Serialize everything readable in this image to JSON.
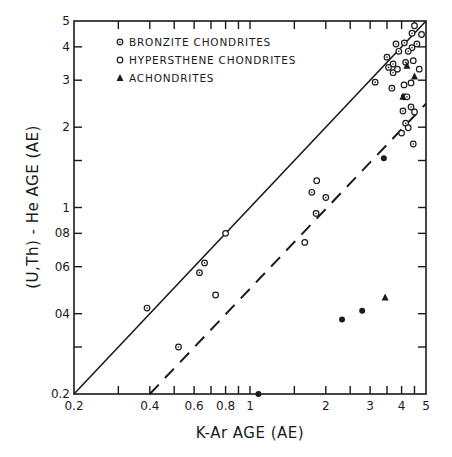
{
  "chart_data": {
    "type": "scatter",
    "title": "",
    "xlabel": "K-Ar AGE (AE)",
    "ylabel": "(U,Th) - He AGE (AE)",
    "xscale": "log",
    "yscale": "log",
    "xlim": [
      0.2,
      5
    ],
    "ylim": [
      0.2,
      5
    ],
    "grid": false,
    "legend_position": "upper-left (inside)",
    "x_ticks": [
      {
        "value": 0.2,
        "label": "0.2"
      },
      {
        "value": 0.3,
        "label": ""
      },
      {
        "value": 0.4,
        "label": "0.4"
      },
      {
        "value": 0.5,
        "label": ""
      },
      {
        "value": 0.6,
        "label": "0.6"
      },
      {
        "value": 0.7,
        "label": ""
      },
      {
        "value": 0.8,
        "label": "0.8"
      },
      {
        "value": 0.9,
        "label": ""
      },
      {
        "value": 1,
        "label": "1"
      },
      {
        "value": 1.5,
        "label": ""
      },
      {
        "value": 2,
        "label": "2"
      },
      {
        "value": 2.5,
        "label": ""
      },
      {
        "value": 3,
        "label": "3"
      },
      {
        "value": 3.5,
        "label": ""
      },
      {
        "value": 4,
        "label": "4"
      },
      {
        "value": 4.5,
        "label": ""
      },
      {
        "value": 5,
        "label": "5"
      }
    ],
    "y_ticks": [
      {
        "value": 0.2,
        "label": "0.2"
      },
      {
        "value": 0.3,
        "label": ""
      },
      {
        "value": 0.4,
        "label": "04"
      },
      {
        "value": 0.6,
        "label": "06"
      },
      {
        "value": 0.8,
        "label": "08"
      },
      {
        "value": 1,
        "label": "1"
      },
      {
        "value": 1.5,
        "label": ""
      },
      {
        "value": 2,
        "label": "2"
      },
      {
        "value": 3,
        "label": "3"
      },
      {
        "value": 4,
        "label": "4"
      },
      {
        "value": 5,
        "label": "5"
      }
    ],
    "reference_lines": [
      {
        "name": "equal-ages",
        "style": "solid",
        "points": [
          [
            0.2,
            0.2
          ],
          [
            5,
            5
          ]
        ]
      },
      {
        "name": "half-ratio",
        "style": "dashed",
        "points": [
          [
            0.4,
            0.2
          ],
          [
            5,
            2.45
          ]
        ]
      }
    ],
    "legend": [
      {
        "label": "BRONZITE CHONDRITES",
        "marker": "circle-dot"
      },
      {
        "label": "HYPERSTHENE CHONDRITES",
        "marker": "open-circle"
      },
      {
        "label": "ACHONDRITES",
        "marker": "filled-triangle"
      }
    ],
    "series": [
      {
        "name": "BRONZITE CHONDRITES",
        "marker": "circle-dot",
        "points": [
          [
            0.39,
            0.42
          ],
          [
            0.63,
            0.57
          ],
          [
            0.66,
            0.62
          ],
          [
            0.52,
            0.3
          ],
          [
            1.76,
            1.14
          ],
          [
            1.83,
            0.95
          ],
          [
            2.0,
            1.09
          ],
          [
            3.14,
            2.95
          ],
          [
            3.66,
            2.8
          ],
          [
            4.1,
            2.6
          ],
          [
            4.2,
            2.6
          ],
          [
            4.05,
            2.3
          ],
          [
            4.36,
            2.38
          ],
          [
            4.15,
            2.07
          ],
          [
            4.45,
            1.73
          ],
          [
            3.5,
            3.66
          ],
          [
            3.7,
            3.45
          ],
          [
            3.9,
            3.85
          ],
          [
            4.1,
            4.14
          ],
          [
            4.4,
            4.5
          ],
          [
            4.4,
            3.97
          ],
          [
            4.6,
            4.1
          ],
          [
            3.7,
            3.2
          ],
          [
            4.15,
            3.5
          ],
          [
            3.8,
            4.1
          ],
          [
            4.25,
            3.85
          ],
          [
            3.55,
            3.35
          ]
        ]
      },
      {
        "name": "HYPERSTHENE CHONDRITES",
        "marker": "open-circle",
        "points": [
          [
            0.8,
            0.8
          ],
          [
            0.73,
            0.47
          ],
          [
            1.84,
            1.26
          ],
          [
            1.65,
            0.74
          ],
          [
            4.09,
            2.88
          ],
          [
            4.36,
            2.93
          ],
          [
            4.5,
            2.28
          ],
          [
            4.25,
            1.99
          ],
          [
            4.0,
            1.9
          ],
          [
            3.85,
            3.3
          ],
          [
            4.45,
            3.55
          ],
          [
            4.7,
            3.3
          ],
          [
            4.8,
            4.45
          ],
          [
            4.5,
            4.8
          ]
        ]
      },
      {
        "name": "ACHONDRITES",
        "marker": "filled-triangle",
        "points": [
          [
            3.44,
            0.46
          ],
          [
            4.05,
            2.6
          ],
          [
            4.5,
            3.1
          ],
          [
            4.2,
            3.4
          ]
        ]
      },
      {
        "name": "filled-circles",
        "marker": "filled-circle",
        "points": [
          [
            2.32,
            0.38
          ],
          [
            2.79,
            0.41
          ],
          [
            1.08,
            0.2
          ],
          [
            3.4,
            1.53
          ]
        ]
      }
    ]
  }
}
